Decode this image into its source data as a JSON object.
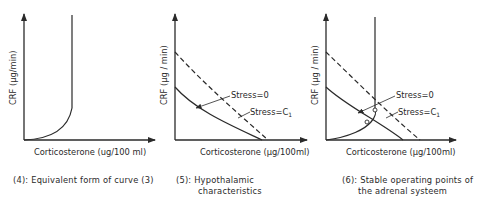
{
  "panels": [
    {
      "id": "panel-4",
      "ylabel": "CRF (µg/min)",
      "xlabel": "Corticosterone (ug/100 ml)",
      "caption_line1": "(4): Equivalent form of curve (3)",
      "caption_line2": "",
      "curves": [
        {
          "name": "adrenal-curve",
          "style": "solid",
          "description": "rises slowly from origin then becomes vertical"
        }
      ]
    },
    {
      "id": "panel-5",
      "ylabel": "CRF (µg / min)",
      "xlabel": "Corticosterone (µg/100ml)",
      "caption_line1": "(5): Hypothalamic",
      "caption_line2": "characteristics",
      "curves": [
        {
          "name": "stress-0",
          "label": "Stress = 0",
          "style": "solid"
        },
        {
          "name": "stress-c1",
          "label": "Stress = C₁",
          "style": "dashed"
        }
      ]
    },
    {
      "id": "panel-6",
      "ylabel": "CRF (µg / min)",
      "xlabel": "Corticosterone (µg/100ml)",
      "caption_line1": "(6): Stable operating points of",
      "caption_line2": "the adrenal systeem",
      "curves": [
        {
          "name": "adrenal-curve",
          "style": "solid"
        },
        {
          "name": "stress-0",
          "label": "Stress = 0",
          "style": "solid"
        },
        {
          "name": "stress-c1",
          "label": "Stress = C₁",
          "style": "dashed"
        }
      ],
      "operating_points": [
        "stress-0 intersection",
        "stress-c1 intersection"
      ]
    }
  ],
  "labels": {
    "stress0": "Stress=0",
    "stressC": "Stress=C",
    "sub1": "1"
  }
}
